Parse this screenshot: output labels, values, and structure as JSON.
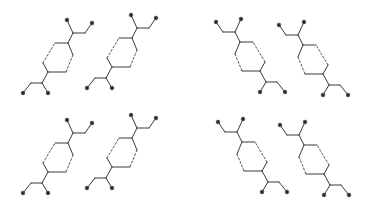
{
  "diagram": {
    "type": "molecular-packing",
    "background": "#ffffff",
    "bond_color": "#3a3a3a",
    "atom_color": "#2a2a2a",
    "atom_radius": 1.9,
    "molecule_template": {
      "atoms": {
        "O1": [
          67,
          20
        ],
        "O2": [
          92,
          23
        ],
        "C_top": [
          73,
          33
        ],
        "CH2_top": [
          85,
          33
        ],
        "ring_T2": [
          68,
          43
        ],
        "ring_T1": [
          55,
          43
        ],
        "ring_R": [
          73,
          55
        ],
        "ring_B2": [
          66,
          72
        ],
        "ring_B1": [
          48,
          72
        ],
        "ring_L": [
          43,
          63
        ],
        "C_bot": [
          42,
          83
        ],
        "CH2_bot": [
          31,
          83
        ],
        "O3": [
          23,
          93
        ],
        "O4": [
          48,
          93
        ]
      },
      "oxygen_atoms": [
        "O1",
        "O2",
        "O3",
        "O4"
      ],
      "bonds": [
        [
          "O1",
          "C_top",
          "solid"
        ],
        [
          "C_top",
          "CH2_top",
          "solid"
        ],
        [
          "CH2_top",
          "O2",
          "solid"
        ],
        [
          "C_top",
          "ring_T2",
          "solid"
        ],
        [
          "ring_T1",
          "ring_T2",
          "solid"
        ],
        [
          "ring_T2",
          "ring_R",
          "solid"
        ],
        [
          "ring_R",
          "ring_B2",
          "dashed"
        ],
        [
          "ring_B2",
          "ring_B1",
          "solid"
        ],
        [
          "ring_B1",
          "ring_L",
          "solid"
        ],
        [
          "ring_L",
          "ring_T1",
          "dashed"
        ],
        [
          "ring_B1",
          "C_bot",
          "solid"
        ],
        [
          "C_bot",
          "CH2_bot",
          "solid"
        ],
        [
          "CH2_bot",
          "O3",
          "solid"
        ],
        [
          "C_bot",
          "O4",
          "solid"
        ]
      ]
    },
    "molecules": [
      {
        "id": "molecule-1",
        "mirror": false,
        "dx": 0,
        "dy": 0
      },
      {
        "id": "molecule-2",
        "mirror": false,
        "dx": 64,
        "dy": -5
      },
      {
        "id": "molecule-3",
        "mirror": true,
        "dx": 0,
        "dy": -1
      },
      {
        "id": "molecule-4",
        "mirror": true,
        "dx": 63,
        "dy": 2
      },
      {
        "id": "molecule-5",
        "mirror": false,
        "dx": 0,
        "dy": 100
      },
      {
        "id": "molecule-6",
        "mirror": false,
        "dx": 64,
        "dy": 95
      },
      {
        "id": "molecule-7",
        "mirror": true,
        "dx": 2,
        "dy": 99
      },
      {
        "id": "molecule-8",
        "mirror": true,
        "dx": 64,
        "dy": 102
      }
    ],
    "mirror_axis_sum": 308
  }
}
